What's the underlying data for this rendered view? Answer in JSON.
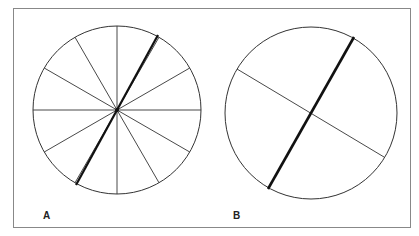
{
  "figure": {
    "panels": [
      {
        "id": "A",
        "label": "A",
        "circle": {
          "cx": 117,
          "cy": 110,
          "r": 84
        },
        "thin_spoke_count": 12,
        "spoke_angles_deg": [
          0,
          30,
          60,
          90,
          120,
          150,
          180,
          210,
          240,
          270,
          300,
          330
        ],
        "thick_line": {
          "x1": 158,
          "y1": 35,
          "x2": 76,
          "y2": 185
        }
      },
      {
        "id": "B",
        "label": "B",
        "circle": {
          "cx": 311,
          "cy": 113,
          "r": 86
        },
        "thin_line": {
          "x1": 237,
          "y1": 69,
          "x2": 384,
          "y2": 157
        },
        "thick_line": {
          "x1": 354,
          "y1": 37,
          "x2": 268,
          "y2": 189
        }
      }
    ],
    "colors": {
      "stroke": "#333333",
      "thick_stroke": "#111111",
      "frame": "#888888",
      "background": "#ffffff"
    }
  }
}
